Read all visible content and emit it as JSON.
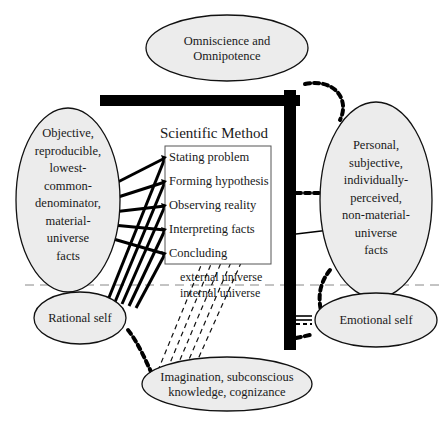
{
  "diagram": {
    "nodes": {
      "omniscience": {
        "line1": "Omniscience and",
        "line2": "Omnipotence"
      },
      "objective_facts": {
        "lines": [
          "Objective,",
          "reproducible,",
          "lowest-",
          "common-",
          "denominator,",
          "material-",
          "universe",
          "facts"
        ]
      },
      "personal_facts": {
        "lines": [
          "Personal,",
          "subjective,",
          "individually-",
          "perceived,",
          "non-material-",
          "universe",
          "facts"
        ]
      },
      "rational_self": {
        "label": "Rational self"
      },
      "emotional_self": {
        "label": "Emotional self"
      },
      "imagination": {
        "line1": "Imagination, subconscious",
        "line2": "knowledge, cognizance"
      }
    },
    "scientific_method": {
      "title": "Scientific Method",
      "steps": [
        "Stating problem",
        "Forming hypothesis",
        "Observing reality",
        "Interpreting facts",
        "Concluding"
      ]
    },
    "boundary": {
      "above": "external universe",
      "below": "internal universe"
    },
    "colors": {
      "ellipse_fill": "#ececec",
      "stroke": "#111111",
      "boundary_line": "#888888"
    }
  }
}
